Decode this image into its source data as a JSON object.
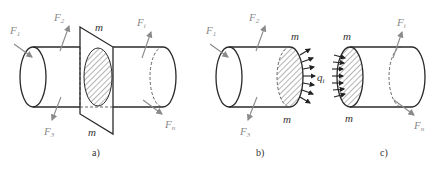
{
  "figure": {
    "panels": [
      {
        "id": "a",
        "caption": "a)",
        "labels": {
          "F1": "F",
          "F1_sub": "1",
          "F2": "F",
          "F2_sub": "2",
          "F3": "F",
          "F3_sub": "3",
          "Fi": "F",
          "Fi_sub": "i",
          "Fn": "F",
          "Fn_sub": "n",
          "m_top": "m",
          "m_bottom": "m"
        }
      },
      {
        "id": "b",
        "caption": "b)",
        "labels": {
          "F1": "F",
          "F1_sub": "1",
          "F2": "F",
          "F2_sub": "2",
          "F3": "F",
          "F3_sub": "3",
          "m_top": "m",
          "m_bottom": "m",
          "q": "q",
          "q_sub": "i"
        }
      },
      {
        "id": "c",
        "caption": "c)",
        "labels": {
          "Fi": "F",
          "Fi_sub": "i",
          "Fn": "F",
          "Fn_sub": "n",
          "m_top": "m",
          "m_bottom": "m"
        }
      }
    ],
    "colors": {
      "outline": "#2a2a2a",
      "force_arrow": "#8a8a8a",
      "hatch": "#444444",
      "background": "#ffffff"
    }
  }
}
